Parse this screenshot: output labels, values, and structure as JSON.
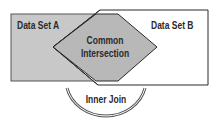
{
  "diagram": {
    "type": "set-join",
    "labels": {
      "set_a": "Data Set A",
      "set_b": "Data Set B",
      "intersection_line1": "Common",
      "intersection_line2": "Intersection",
      "join": "Inner Join"
    },
    "colors": {
      "set_a_fill": "#c8c8c8",
      "intersection_fill": "#b4b4b4",
      "set_b_fill": "#ffffff",
      "stroke": "#2a2a2a"
    }
  }
}
